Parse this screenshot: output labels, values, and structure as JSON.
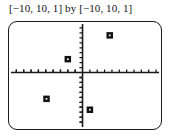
{
  "window": {
    "title": "[−10, 10, 1] by [−10, 10, 1]"
  },
  "viewport": {
    "xmin": -10,
    "xmax": 10,
    "xscl": 1,
    "ymin": -10,
    "ymax": 10,
    "yscl": 1
  },
  "colors": {
    "axis": "#1a1a1a",
    "frame": "#1a1a1a",
    "marker": "#111111",
    "background": "#ffffff",
    "text": "#111111"
  },
  "chart_data": {
    "type": "scatter",
    "title": "[−10, 10, 1] by [−10, 10, 1]",
    "xlabel": "",
    "ylabel": "",
    "xlim": [
      -10,
      10
    ],
    "ylim": [
      -10,
      10
    ],
    "xscl": 1,
    "yscl": 1,
    "grid": false,
    "legend": false,
    "marker_style": "square",
    "series": [
      {
        "name": "points",
        "points": [
          {
            "x": 3.7,
            "y": 7.5
          },
          {
            "x": -2.0,
            "y": 2.7
          },
          {
            "x": -4.9,
            "y": -5.3
          },
          {
            "x": 1.0,
            "y": -7.5
          }
        ]
      }
    ]
  }
}
